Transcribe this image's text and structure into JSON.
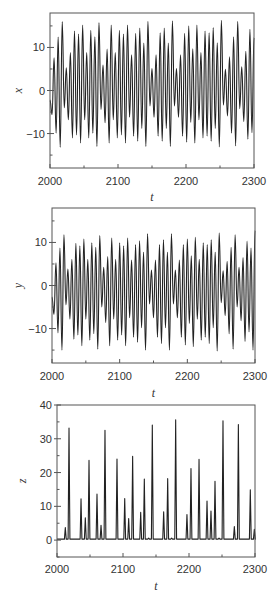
{
  "chart_data": [
    {
      "type": "line",
      "title": "",
      "xlabel": "t",
      "ylabel": "x",
      "xlim": [
        2000,
        2300
      ],
      "ylim": [
        -18,
        18
      ],
      "xticks": [
        2000,
        2100,
        2200,
        2300
      ],
      "xtick_labels": [
        "2000",
        "2100",
        "2200",
        "2300"
      ],
      "yticks": [
        10,
        0,
        -10
      ],
      "ytick_labels": [
        "10",
        "0",
        "−10"
      ],
      "grid": false,
      "legend": null,
      "series": [
        {
          "name": "x(t)",
          "description": "oscillation extrema (alternating peak/trough) sampled over t in [2000,2300]",
          "peaks": [
            7.6,
            12.4,
            16.0,
            5.3,
            8.8,
            13.8,
            13.1,
            15.2,
            8.8,
            14.0,
            12.5,
            15.8,
            5.9,
            9.6,
            15.2,
            8.8,
            14.0,
            13.1,
            15.2,
            8.3,
            13.3,
            14.5,
            11.0,
            16.1,
            5.1,
            8.3,
            13.4,
            14.5,
            11.0,
            16.2,
            5.1,
            8.3,
            13.3,
            15.0,
            9.7,
            15.2,
            8.8,
            13.8,
            13.4,
            14.6,
            11.1,
            16.3,
            4.9,
            7.8,
            12.5,
            16.1,
            5.5,
            9.1,
            14.2,
            12.3
          ],
          "troughs": [
            -5.6,
            -9.9,
            -13.2,
            -4.0,
            -6.8,
            -11.0,
            -10.3,
            -12.2,
            -6.8,
            -11.0,
            -9.9,
            -13.0,
            -4.4,
            -7.5,
            -12.2,
            -6.8,
            -11.0,
            -10.3,
            -12.2,
            -6.2,
            -10.6,
            -11.8,
            -8.8,
            -13.0,
            -3.6,
            -6.2,
            -10.6,
            -11.8,
            -8.8,
            -13.0,
            -3.6,
            -6.2,
            -10.6,
            -12.0,
            -7.4,
            -12.2,
            -6.8,
            -11.0,
            -10.6,
            -11.8,
            -8.8,
            -13.1,
            -3.4,
            -5.9,
            -9.9,
            -12.9,
            -4.2,
            -7.2,
            -11.3,
            -9.8
          ]
        }
      ]
    },
    {
      "type": "line",
      "title": "",
      "xlabel": "t",
      "ylabel": "y",
      "xlim": [
        2000,
        2300
      ],
      "ylim": [
        -18,
        18
      ],
      "xticks": [
        2000,
        2100,
        2200,
        2300
      ],
      "xtick_labels": [
        "2000",
        "2100",
        "2200",
        "2300"
      ],
      "yticks": [
        10,
        0,
        -10
      ],
      "ytick_labels": [
        "10",
        "0",
        "−10"
      ],
      "grid": false,
      "legend": null,
      "series": [
        {
          "name": "y(t)",
          "description": "oscillation extrema (alternating peak/trough) sampled over t in [2000,2300]",
          "peaks": [
            5.3,
            8.7,
            11.8,
            3.8,
            6.1,
            9.8,
            9.2,
            10.8,
            6.1,
            9.9,
            8.9,
            11.6,
            4.2,
            6.7,
            11.0,
            6.1,
            9.9,
            9.2,
            11.0,
            5.9,
            9.5,
            10.4,
            7.7,
            12.0,
            3.6,
            5.9,
            9.5,
            10.6,
            7.7,
            12.0,
            3.6,
            5.9,
            9.5,
            10.8,
            6.9,
            11.2,
            6.1,
            9.9,
            9.5,
            10.6,
            7.7,
            12.2,
            3.4,
            5.6,
            8.9,
            11.8,
            4.2,
            6.5,
            10.3,
            8.7,
            12.8
          ],
          "troughs": [
            -6.7,
            -11.0,
            -15.0,
            -4.5,
            -7.8,
            -12.5,
            -11.5,
            -14.0,
            -7.8,
            -12.7,
            -11.2,
            -14.8,
            -5.0,
            -8.6,
            -14.0,
            -7.8,
            -12.7,
            -11.5,
            -14.0,
            -7.5,
            -12.0,
            -13.2,
            -9.8,
            -15.0,
            -4.3,
            -7.5,
            -12.0,
            -13.5,
            -9.8,
            -15.0,
            -4.3,
            -7.5,
            -12.0,
            -13.8,
            -8.8,
            -14.2,
            -7.8,
            -12.7,
            -12.0,
            -13.5,
            -9.8,
            -15.2,
            -4.0,
            -7.0,
            -11.2,
            -14.8,
            -5.0,
            -8.2,
            -13.0,
            -10.8,
            -15.0
          ]
        }
      ]
    },
    {
      "type": "line",
      "title": "",
      "xlabel": "t",
      "ylabel": "z",
      "xlim": [
        2000,
        2300
      ],
      "ylim": [
        -5,
        40
      ],
      "xticks": [
        2000,
        2100,
        2200,
        2300
      ],
      "xtick_labels": [
        "2000",
        "2100",
        "2200",
        "2300"
      ],
      "yticks": [
        40,
        30,
        20,
        10,
        0
      ],
      "ytick_labels": [
        "40",
        "30",
        "20",
        "10",
        "0"
      ],
      "grid": false,
      "legend": null,
      "series": [
        {
          "name": "z(t)",
          "description": "baseline ~0 with sharp spikes; spike times t and heights z",
          "spikes": [
            {
              "t": 2012.6,
              "z": 3.7
            },
            {
              "t": 2018.2,
              "z": 33.2
            },
            {
              "t": 2036.4,
              "z": 12.2
            },
            {
              "t": 2042.9,
              "z": 6.6
            },
            {
              "t": 2048.5,
              "z": 23.6
            },
            {
              "t": 2060.6,
              "z": 13.6
            },
            {
              "t": 2066.7,
              "z": 4.4
            },
            {
              "t": 2072.7,
              "z": 32.5
            },
            {
              "t": 2090.9,
              "z": 24.0
            },
            {
              "t": 2102.6,
              "z": 12.3
            },
            {
              "t": 2108.6,
              "z": 6.4
            },
            {
              "t": 2114.6,
              "z": 24.8
            },
            {
              "t": 2126.8,
              "z": 8.2
            },
            {
              "t": 2132.3,
              "z": 18.1
            },
            {
              "t": 2138.9,
              "z": 0.6
            },
            {
              "t": 2144.4,
              "z": 34.1
            },
            {
              "t": 2161.6,
              "z": 8.4
            },
            {
              "t": 2167.7,
              "z": 18.2
            },
            {
              "t": 2173.7,
              "z": 0.6
            },
            {
              "t": 2179.8,
              "z": 35.6
            },
            {
              "t": 2196.9,
              "z": 7.6
            },
            {
              "t": 2203.0,
              "z": 21.2
            },
            {
              "t": 2215.2,
              "z": 23.9
            },
            {
              "t": 2227.3,
              "z": 11.6
            },
            {
              "t": 2233.3,
              "z": 8.6
            },
            {
              "t": 2239.4,
              "z": 17.4
            },
            {
              "t": 2245.5,
              "z": 0.6
            },
            {
              "t": 2251.5,
              "z": 35.3
            },
            {
              "t": 2268.7,
              "z": 4.0
            },
            {
              "t": 2274.8,
              "z": 34.2
            },
            {
              "t": 2292.9,
              "z": 14.9
            },
            {
              "t": 2299.0,
              "z": 3.2
            }
          ]
        }
      ]
    }
  ]
}
